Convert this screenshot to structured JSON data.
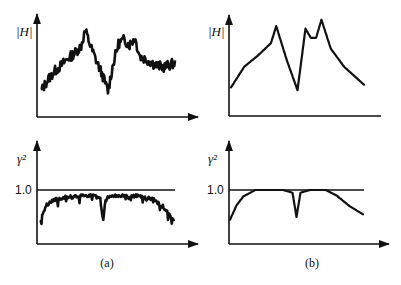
{
  "figure": {
    "panels": [
      {
        "id": "a",
        "caption": "(a)"
      },
      {
        "id": "b",
        "caption": "(b)"
      }
    ]
  },
  "chart_data": [
    {
      "panel": "a",
      "type": "line",
      "title": "",
      "ylabel": "|H|",
      "xlabel": "",
      "description": "Measured frequency response magnitude (noisy)",
      "x": [
        0,
        0.05,
        0.1,
        0.15,
        0.2,
        0.25,
        0.3,
        0.33,
        0.38,
        0.42,
        0.46,
        0.5,
        0.54,
        0.58,
        0.62,
        0.66,
        0.7,
        0.74,
        0.8,
        0.86,
        0.92,
        1.0
      ],
      "values": [
        0.22,
        0.35,
        0.45,
        0.52,
        0.6,
        0.66,
        0.75,
        0.93,
        0.7,
        0.55,
        0.4,
        0.22,
        0.55,
        0.78,
        0.82,
        0.76,
        0.84,
        0.62,
        0.58,
        0.52,
        0.5,
        0.55
      ],
      "noisy": true,
      "grid": false
    },
    {
      "panel": "a",
      "type": "line",
      "title": "",
      "ylabel": "γ²",
      "xlabel": "",
      "description": "Measured coherence (noisy)",
      "reference_line": {
        "value": 1.0,
        "label": "1.0"
      },
      "x": [
        0,
        0.05,
        0.1,
        0.2,
        0.3,
        0.4,
        0.45,
        0.47,
        0.49,
        0.55,
        0.65,
        0.75,
        0.85,
        0.92,
        1.0
      ],
      "values": [
        0.45,
        0.75,
        0.85,
        0.9,
        0.92,
        0.92,
        0.88,
        0.45,
        0.88,
        0.92,
        0.92,
        0.92,
        0.85,
        0.72,
        0.45
      ],
      "noisy": true,
      "ylim": [
        0,
        1.6
      ],
      "grid": false
    },
    {
      "panel": "b",
      "type": "line",
      "title": "",
      "ylabel": "|H|",
      "xlabel": "",
      "description": "Ideal frequency response magnitude",
      "x": [
        0,
        0.1,
        0.2,
        0.3,
        0.34,
        0.42,
        0.5,
        0.56,
        0.6,
        0.64,
        0.68,
        0.75,
        0.85,
        1.0
      ],
      "values": [
        0.25,
        0.48,
        0.6,
        0.74,
        0.93,
        0.55,
        0.22,
        0.9,
        0.8,
        0.8,
        1.0,
        0.68,
        0.48,
        0.28
      ],
      "noisy": false,
      "grid": false
    },
    {
      "panel": "b",
      "type": "line",
      "title": "",
      "ylabel": "γ²",
      "xlabel": "",
      "description": "Ideal coherence",
      "reference_line": {
        "value": 1.0,
        "label": "1.0"
      },
      "x": [
        0,
        0.05,
        0.1,
        0.19,
        0.4,
        0.47,
        0.5,
        0.53,
        0.6,
        0.72,
        0.8,
        0.9,
        1.0
      ],
      "values": [
        0.45,
        0.72,
        0.88,
        1.0,
        1.0,
        0.95,
        0.5,
        0.95,
        1.0,
        1.0,
        0.9,
        0.7,
        0.55
      ],
      "noisy": false,
      "ylim": [
        0,
        1.6
      ],
      "grid": false
    }
  ]
}
